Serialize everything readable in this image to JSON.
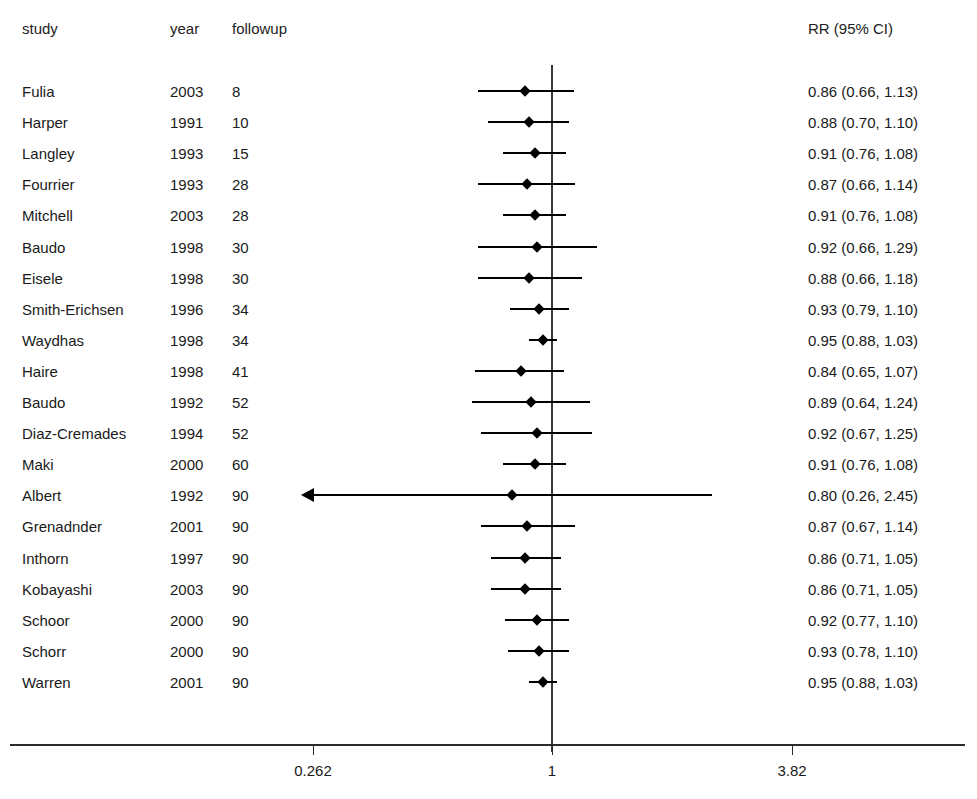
{
  "figure": {
    "type": "forest-plot",
    "headers": {
      "study": "study",
      "year": "year",
      "followup": "followup",
      "effect": "RR (95% CI)"
    }
  },
  "chart_data": {
    "type": "scatter",
    "plot_kind": "forest-plot",
    "title": "",
    "xlabel": "",
    "ylabel": "",
    "scale": "log",
    "grid": false,
    "legend": null,
    "reference_line": 1,
    "xticks": [
      "0.262",
      "1",
      "3.82"
    ],
    "xtick_values": [
      0.262,
      1,
      3.82
    ],
    "xlim": [
      0.262,
      3.82
    ],
    "columns": [
      "study",
      "year",
      "followup",
      "RR (95% CI)"
    ],
    "rows": [
      {
        "study": "Fulia",
        "year": "2003",
        "followup": "8",
        "label": "0.86 (0.66, 1.13)",
        "rr": 0.86,
        "lo": 0.66,
        "hi": 1.13,
        "clipped_low": false
      },
      {
        "study": "Harper",
        "year": "1991",
        "followup": "10",
        "label": "0.88 (0.70, 1.10)",
        "rr": 0.88,
        "lo": 0.7,
        "hi": 1.1,
        "clipped_low": false
      },
      {
        "study": "Langley",
        "year": "1993",
        "followup": "15",
        "label": "0.91 (0.76, 1.08)",
        "rr": 0.91,
        "lo": 0.76,
        "hi": 1.08,
        "clipped_low": false
      },
      {
        "study": "Fourrier",
        "year": "1993",
        "followup": "28",
        "label": "0.87 (0.66, 1.14)",
        "rr": 0.87,
        "lo": 0.66,
        "hi": 1.14,
        "clipped_low": false
      },
      {
        "study": "Mitchell",
        "year": "2003",
        "followup": "28",
        "label": "0.91 (0.76, 1.08)",
        "rr": 0.91,
        "lo": 0.76,
        "hi": 1.08,
        "clipped_low": false
      },
      {
        "study": "Baudo",
        "year": "1998",
        "followup": "30",
        "label": "0.92 (0.66, 1.29)",
        "rr": 0.92,
        "lo": 0.66,
        "hi": 1.29,
        "clipped_low": false
      },
      {
        "study": "Eisele",
        "year": "1998",
        "followup": "30",
        "label": "0.88 (0.66, 1.18)",
        "rr": 0.88,
        "lo": 0.66,
        "hi": 1.18,
        "clipped_low": false
      },
      {
        "study": "Smith-Erichsen",
        "year": "1996",
        "followup": "34",
        "label": "0.93 (0.79, 1.10)",
        "rr": 0.93,
        "lo": 0.79,
        "hi": 1.1,
        "clipped_low": false
      },
      {
        "study": "Waydhas",
        "year": "1998",
        "followup": "34",
        "label": "0.95 (0.88, 1.03)",
        "rr": 0.95,
        "lo": 0.88,
        "hi": 1.03,
        "clipped_low": false
      },
      {
        "study": "Haire",
        "year": "1998",
        "followup": "41",
        "label": "0.84 (0.65, 1.07)",
        "rr": 0.84,
        "lo": 0.65,
        "hi": 1.07,
        "clipped_low": false
      },
      {
        "study": "Baudo",
        "year": "1992",
        "followup": "52",
        "label": "0.89 (0.64, 1.24)",
        "rr": 0.89,
        "lo": 0.64,
        "hi": 1.24,
        "clipped_low": false
      },
      {
        "study": "Diaz-Cremades",
        "year": "1994",
        "followup": "52",
        "label": "0.92 (0.67, 1.25)",
        "rr": 0.92,
        "lo": 0.67,
        "hi": 1.25,
        "clipped_low": false
      },
      {
        "study": "Maki",
        "year": "2000",
        "followup": "60",
        "label": "0.91 (0.76, 1.08)",
        "rr": 0.91,
        "lo": 0.76,
        "hi": 1.08,
        "clipped_low": false
      },
      {
        "study": "Albert",
        "year": "1992",
        "followup": "90",
        "label": "0.80 (0.26, 2.45)",
        "rr": 0.8,
        "lo": 0.26,
        "hi": 2.45,
        "clipped_low": true
      },
      {
        "study": "Grenadnder",
        "year": "2001",
        "followup": "90",
        "label": "0.87 (0.67, 1.14)",
        "rr": 0.87,
        "lo": 0.67,
        "hi": 1.14,
        "clipped_low": false
      },
      {
        "study": "Inthorn",
        "year": "1997",
        "followup": "90",
        "label": "0.86 (0.71, 1.05)",
        "rr": 0.86,
        "lo": 0.71,
        "hi": 1.05,
        "clipped_low": false
      },
      {
        "study": "Kobayashi",
        "year": "2003",
        "followup": "90",
        "label": "0.86 (0.71, 1.05)",
        "rr": 0.86,
        "lo": 0.71,
        "hi": 1.05,
        "clipped_low": false
      },
      {
        "study": "Schoor",
        "year": "2000",
        "followup": "90",
        "label": "0.92 (0.77, 1.10)",
        "rr": 0.92,
        "lo": 0.77,
        "hi": 1.1,
        "clipped_low": false
      },
      {
        "study": "Schorr",
        "year": "2000",
        "followup": "90",
        "label": "0.93 (0.78, 1.10)",
        "rr": 0.93,
        "lo": 0.78,
        "hi": 1.1,
        "clipped_low": false
      },
      {
        "study": "Warren",
        "year": "2001",
        "followup": "90",
        "label": "0.95 (0.88, 1.03)",
        "rr": 0.95,
        "lo": 0.88,
        "hi": 1.03,
        "clipped_low": false
      }
    ]
  },
  "geometry": {
    "first_row_y": 91,
    "row_step": 31.1,
    "tick_x": {
      "left": 313,
      "center": 552,
      "right": 792
    }
  }
}
